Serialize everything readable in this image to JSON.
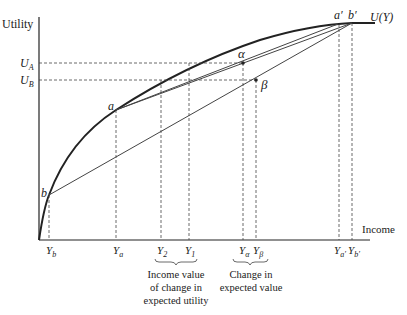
{
  "axes": {
    "y_label": "Utility",
    "x_label": "Income",
    "curve_label": "U(Y)"
  },
  "utility_levels": [
    {
      "id": "UA",
      "main": "U",
      "sub": "A"
    },
    {
      "id": "UB",
      "main": "U",
      "sub": "B"
    }
  ],
  "points": {
    "a": "a",
    "b": "b",
    "a_prime": "a′",
    "b_prime": "b′",
    "alpha": "α",
    "beta": "β"
  },
  "x_ticks": [
    {
      "id": "Yb",
      "main": "Y",
      "sub": "b"
    },
    {
      "id": "Ya",
      "main": "Y",
      "sub": "a"
    },
    {
      "id": "Y2",
      "main": "Y",
      "sub": "2"
    },
    {
      "id": "Y1",
      "main": "Y",
      "sub": "1"
    },
    {
      "id": "Yalpha",
      "main": "Y",
      "sub": "α"
    },
    {
      "id": "Ybeta",
      "main": "Y",
      "sub": "β"
    },
    {
      "id": "Yaprime",
      "main": "Y",
      "sub": "a′"
    },
    {
      "id": "Ybprime",
      "main": "Y",
      "sub": "b′"
    }
  ],
  "annotations": {
    "income_value": [
      "Income value",
      "of change in",
      "expected utility"
    ],
    "change_expected": [
      "Change in",
      "expected value"
    ]
  }
}
